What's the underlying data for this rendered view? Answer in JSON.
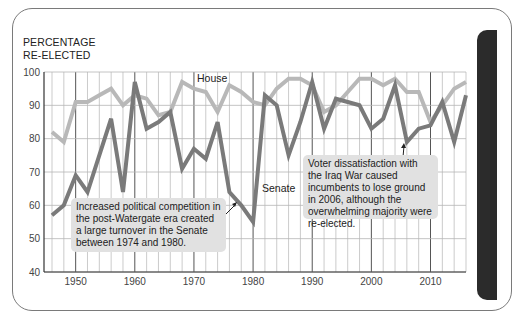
{
  "chart_data": {
    "type": "line",
    "title": "",
    "ylabel": "PERCENTAGE RE-ELECTED",
    "ylabel_lines": [
      "PERCENTAGE",
      "RE-ELECTED"
    ],
    "xlabel": "",
    "ylim": [
      40,
      100
    ],
    "xlim": [
      1946,
      2016
    ],
    "yticks": [
      40,
      50,
      60,
      70,
      80,
      90,
      100
    ],
    "xticks": [
      1950,
      1960,
      1970,
      1980,
      1990,
      2000,
      2010
    ],
    "grid": true,
    "x": [
      1946,
      1948,
      1950,
      1952,
      1954,
      1956,
      1958,
      1960,
      1962,
      1964,
      1966,
      1968,
      1970,
      1972,
      1974,
      1976,
      1978,
      1980,
      1982,
      1984,
      1986,
      1988,
      1990,
      1992,
      1994,
      1996,
      1998,
      2000,
      2002,
      2004,
      2006,
      2008,
      2010,
      2012,
      2014,
      2016
    ],
    "series": [
      {
        "name": "House",
        "color": "#b8b8b8",
        "values": [
          82,
          79,
          91,
          91,
          93,
          95,
          90,
          93,
          92,
          87,
          88,
          97,
          95,
          94,
          88,
          96,
          94,
          91,
          90,
          95,
          98,
          98,
          96,
          88,
          90,
          94,
          98,
          98,
          96,
          98,
          94,
          94,
          85,
          90,
          95,
          97
        ]
      },
      {
        "name": "Senate",
        "color": "#7a7a7a",
        "values": [
          57,
          60,
          69,
          64,
          75,
          86,
          64,
          97,
          83,
          85,
          88,
          71,
          77,
          74,
          85,
          64,
          60,
          55,
          93,
          90,
          75,
          85,
          97,
          83,
          92,
          91,
          90,
          83,
          86,
          96,
          79,
          83,
          84,
          91,
          79,
          93
        ]
      }
    ],
    "annotations": [
      {
        "text": "Increased political competition in the post-Watergate era created a large turnover in the Senate between 1974 and 1980.",
        "points_to": {
          "x": 1977,
          "y": 62
        }
      },
      {
        "text": "Voter dissatisfaction with the Iraq War caused incumbents to lose ground in 2006, although the overwhelming majority were re-elected.",
        "points_to": {
          "x": 2006,
          "y": 79
        }
      }
    ]
  },
  "labels": {
    "ytitle_line1": "PERCENTAGE",
    "ytitle_line2": "RE-ELECTED",
    "house": "House",
    "senate": "Senate",
    "note1": "Increased political competition in the post-Watergate era created a large turnover in the Senate between 1974 and 1980.",
    "note2": "Voter dissatisfaction with the Iraq War caused incumbents to lose ground in 2006, although the overwhelming majority were re-elected."
  }
}
